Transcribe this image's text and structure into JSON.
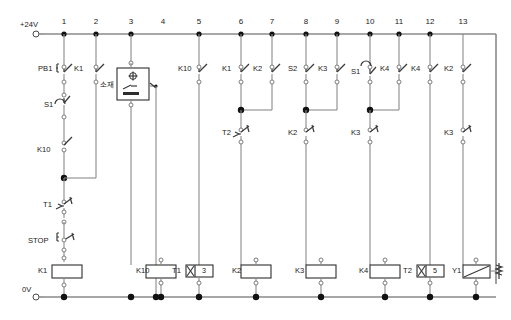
{
  "diagram": {
    "type": "ladder-diagram",
    "supply": {
      "top_label": "+24V",
      "bottom_label": "0V"
    },
    "rail_numbers": [
      "1",
      "2",
      "3",
      "4",
      "5",
      "6",
      "7",
      "8",
      "9",
      "10",
      "11",
      "12",
      "13"
    ],
    "colors": {
      "wire": "#8a8a8a",
      "component_outline": "#2e2e2e",
      "node": "#111111",
      "text": "#1a1a1a",
      "background": "#ffffff"
    },
    "branches": [
      {
        "rail": "1",
        "contacts": [
          {
            "label": "PB1",
            "kind": "pushbutton-no"
          },
          {
            "label": "S1",
            "kind": "limit-switch-no"
          },
          {
            "label": "K10",
            "kind": "contact-no"
          },
          {
            "label": "T1",
            "kind": "timer-contact-nc"
          },
          {
            "label": "STOP",
            "kind": "pushbutton-nc"
          }
        ],
        "output": {
          "label": "K1",
          "kind": "coil"
        }
      },
      {
        "rail": "2",
        "contacts": [
          {
            "label": "K1",
            "kind": "contact-no"
          }
        ],
        "output": null
      },
      {
        "rail": "3",
        "contacts": [
          {
            "label": "소재",
            "kind": "sensor-box"
          }
        ],
        "output": {
          "label": "K10",
          "kind": "coil"
        }
      },
      {
        "rail": "5",
        "contacts": [
          {
            "label": "K10",
            "kind": "contact-no"
          }
        ],
        "output": {
          "label": "T1",
          "kind": "timer",
          "value": "3"
        }
      },
      {
        "rail": "6",
        "contacts": [
          {
            "label": "K1",
            "kind": "contact-no"
          },
          {
            "label": "T2",
            "kind": "timer-contact-nc"
          }
        ],
        "output": {
          "label": "K2",
          "kind": "coil"
        }
      },
      {
        "rail": "7",
        "contacts": [
          {
            "label": "K2",
            "kind": "contact-no"
          }
        ],
        "output": null
      },
      {
        "rail": "8",
        "contacts": [
          {
            "label": "S2",
            "kind": "contact-no"
          },
          {
            "label": "K2",
            "kind": "contact-nc"
          }
        ],
        "output": {
          "label": "K3",
          "kind": "coil"
        }
      },
      {
        "rail": "9",
        "contacts": [
          {
            "label": "K3",
            "kind": "contact-no"
          }
        ],
        "output": null
      },
      {
        "rail": "10",
        "contacts": [
          {
            "label": "S1",
            "kind": "limit-switch-no"
          },
          {
            "label": "K3",
            "kind": "contact-nc"
          }
        ],
        "output": {
          "label": "K4",
          "kind": "coil"
        }
      },
      {
        "rail": "11",
        "contacts": [
          {
            "label": "K4",
            "kind": "contact-no"
          }
        ],
        "output": null
      },
      {
        "rail": "12",
        "contacts": [
          {
            "label": "K4",
            "kind": "contact-no"
          }
        ],
        "output": {
          "label": "T2",
          "kind": "timer",
          "value": "5"
        }
      },
      {
        "rail": "13",
        "contacts": [
          {
            "label": "K2",
            "kind": "contact-no"
          },
          {
            "label": "K3",
            "kind": "contact-nc"
          }
        ],
        "output": {
          "label": "Y1",
          "kind": "solenoid-valve"
        }
      }
    ],
    "labels": {
      "pb1": "PB1",
      "stop": "STOP",
      "s1_a": "S1",
      "s1_b": "S1",
      "s2": "S2",
      "k1_c2": "K1",
      "k1_c6": "K1",
      "k10_c1": "K10",
      "k10_c5": "K10",
      "t1_c1": "T1",
      "t2_c6": "T2",
      "k2_c7": "K2",
      "k2_c8nc": "K2",
      "k3_c9": "K3",
      "k3_c10nc": "K3",
      "k4_c11": "K4",
      "k4_c12": "K4",
      "k2_c13": "K2",
      "k3_c13nc": "K3",
      "sensor_ko": "소재",
      "coil_k1": "K1",
      "coil_k10": "K10",
      "coil_k2": "K2",
      "coil_k3": "K3",
      "coil_k4": "K4",
      "timer_t1": "T1",
      "timer_t1_value": "3",
      "timer_t2": "T2",
      "timer_t2_value": "5",
      "solenoid_y1": "Y1"
    }
  }
}
